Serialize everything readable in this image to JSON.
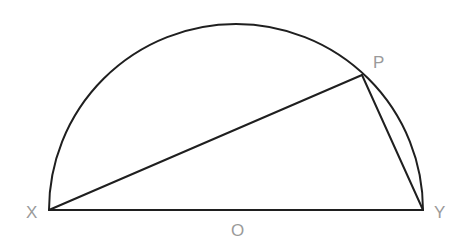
{
  "diagram": {
    "type": "semicircle-inscribed-triangle",
    "colors": {
      "stroke": "#1f1f1f",
      "label": "#9a9a9a",
      "background": "#ffffff"
    },
    "points": {
      "X": {
        "x": 49,
        "y": 210
      },
      "Y": {
        "x": 423,
        "y": 210
      },
      "P": {
        "x": 362,
        "y": 75
      },
      "O": {
        "x": 236,
        "y": 210
      }
    },
    "labels": {
      "X": "X",
      "Y": "Y",
      "P": "P",
      "O": "O"
    },
    "segments": [
      {
        "from": "X",
        "to": "Y",
        "name": "diameter-XY"
      },
      {
        "from": "X",
        "to": "P",
        "name": "chord-XP"
      },
      {
        "from": "P",
        "to": "Y",
        "name": "chord-PY"
      }
    ],
    "arc": {
      "center": "O",
      "radius": 187,
      "from": "X",
      "to": "Y",
      "description": "upper semicircle"
    }
  }
}
